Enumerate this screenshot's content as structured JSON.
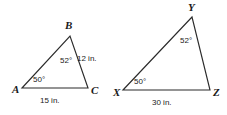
{
  "figure": {
    "type": "geometry-diagram",
    "background_color": "#ffffff",
    "stroke_color": "#2b2b2b",
    "text_color": "#1a1a1a",
    "units": "in.",
    "triangles": [
      {
        "id": "triangle-abc",
        "name": "Triangle ABC",
        "vertices": [
          {
            "key": "A",
            "label": "A",
            "x": 22,
            "y": 88,
            "label_x": 12,
            "label_y": 93
          },
          {
            "key": "B",
            "label": "B",
            "x": 70,
            "y": 36,
            "label_x": 65,
            "label_y": 29
          },
          {
            "key": "C",
            "label": "C",
            "x": 88,
            "y": 88,
            "label_x": 91,
            "label_y": 94
          }
        ],
        "angles": [
          {
            "key": "A",
            "label": "50°",
            "value": 50,
            "x": 33,
            "y": 82
          },
          {
            "key": "B",
            "label": "52°",
            "value": 52,
            "x": 60,
            "y": 63
          }
        ],
        "sides": [
          {
            "key": "BC",
            "label": "12 in.",
            "value": 12,
            "x": 77,
            "y": 61
          },
          {
            "key": "AC",
            "label": "15 in.",
            "value": 15,
            "x": 40,
            "y": 103
          }
        ]
      },
      {
        "id": "triangle-xyz",
        "name": "Triangle XYZ",
        "vertices": [
          {
            "key": "X",
            "label": "X",
            "x": 123,
            "y": 90,
            "label_x": 113,
            "label_y": 96
          },
          {
            "key": "Y",
            "label": "Y",
            "x": 192,
            "y": 17,
            "label_x": 188,
            "label_y": 11
          },
          {
            "key": "Z",
            "label": "Z",
            "x": 210,
            "y": 90,
            "label_x": 213,
            "label_y": 96
          }
        ],
        "angles": [
          {
            "key": "X",
            "label": "50°",
            "value": 50,
            "x": 134,
            "y": 84
          },
          {
            "key": "Y",
            "label": "52°",
            "value": 52,
            "x": 180,
            "y": 43
          }
        ],
        "sides": [
          {
            "key": "XZ",
            "label": "30 in.",
            "value": 30,
            "x": 152,
            "y": 105
          }
        ]
      }
    ]
  }
}
